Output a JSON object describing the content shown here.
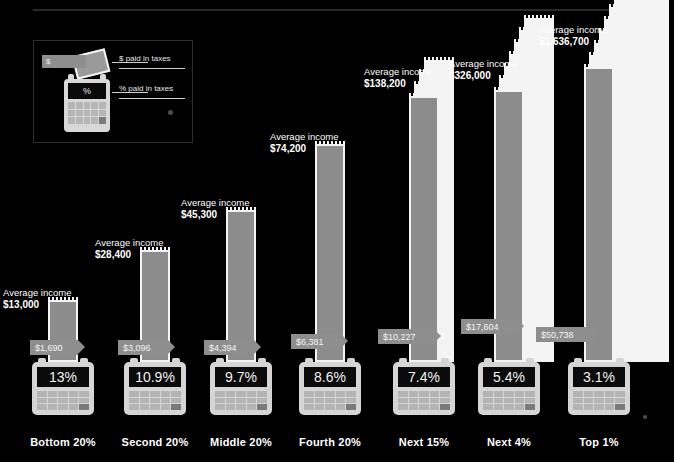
{
  "legend": {
    "dollar_symbol": "$",
    "percent_symbol": "%",
    "label_dollar": "$ paid in taxes",
    "label_percent": "% paid in taxes"
  },
  "labels": {
    "income_caption": "Average income"
  },
  "colors": {
    "background": "#000000",
    "receipt_fill": "#8c8c8c",
    "receipt_border": "#f4f4f4",
    "calculator_body": "#d5d5d5",
    "calculator_screen": "#0b0b0b",
    "tag_fill": "#8e8e8e",
    "text": "#ffffff",
    "rule": "#2a2a2a"
  },
  "chart_data": {
    "type": "bar",
    "title": "",
    "xlabel": "",
    "ylabel": "Average income",
    "categories": [
      "Bottom 20%",
      "Second 20%",
      "Middle 20%",
      "Fourth 20%",
      "Next 15%",
      "Next 4%",
      "Top 1%"
    ],
    "series": [
      {
        "name": "Average income",
        "values": [
          13000,
          28400,
          45300,
          74200,
          138200,
          326000,
          1636700
        ],
        "labels": [
          "$13,000",
          "$28,400",
          "$45,300",
          "$74,200",
          "$138,200",
          "$326,000",
          "$1,636,700"
        ]
      },
      {
        "name": "$ paid in taxes",
        "values": [
          1690,
          3096,
          4394,
          6381,
          10227,
          17604,
          50738
        ],
        "labels": [
          "$1,690",
          "$3,096",
          "$4,394",
          "$6,381",
          "$10,227",
          "$17,604",
          "$50,738"
        ]
      },
      {
        "name": "% paid in taxes",
        "values": [
          13,
          10.9,
          9.7,
          8.6,
          7.4,
          5.4,
          3.1
        ],
        "labels": [
          "13%",
          "10.9%",
          "9.7%",
          "8.6%",
          "7.4%",
          "5.4%",
          "3.1%"
        ]
      }
    ],
    "legend": [
      "$ paid in taxes",
      "% paid in taxes"
    ],
    "legend_position": "top-left",
    "grid": false
  },
  "columns": [
    {
      "category": "Bottom 20%",
      "income": "$13,000",
      "paid": "$1,690",
      "percent": "13%",
      "left": 20,
      "bar_height": 62,
      "bar_bottom": 100,
      "sheets": 1,
      "fan": 0,
      "income_top": 287,
      "tag_bottom": 107,
      "tag_left": 30,
      "tag_width": 48
    },
    {
      "category": "Second 20%",
      "income": "$28,400",
      "paid": "$3,096",
      "percent": "10.9%",
      "left": 112,
      "bar_height": 112,
      "bar_bottom": 100,
      "sheets": 1,
      "fan": 0,
      "income_top": 237,
      "tag_bottom": 107,
      "tag_left": 118,
      "tag_width": 50
    },
    {
      "category": "Middle 20%",
      "income": "$45,300",
      "paid": "$4,394",
      "percent": "9.7%",
      "left": 198,
      "bar_height": 152,
      "bar_bottom": 100,
      "sheets": 1,
      "fan": 0,
      "income_top": 197,
      "tag_bottom": 107,
      "tag_left": 204,
      "tag_width": 50
    },
    {
      "category": "Fourth 20%",
      "income": "$74,200",
      "paid": "$6,381",
      "percent": "8.6%",
      "left": 287,
      "bar_height": 218,
      "bar_bottom": 100,
      "sheets": 1,
      "fan": 0,
      "income_top": 131,
      "tag_bottom": 113,
      "tag_left": 291,
      "tag_width": 50
    },
    {
      "category": "Next 15%",
      "income": "$138,200",
      "paid": "$10,227",
      "percent": "7.4%",
      "left": 381,
      "bar_height": 266,
      "bar_bottom": 100,
      "sheets": 2,
      "fan": 3,
      "income_top": 66,
      "tag_bottom": 118,
      "tag_left": 378,
      "tag_width": 56
    },
    {
      "category": "Next 4%",
      "income": "$326,000",
      "paid": "$17,604",
      "percent": "5.4%",
      "left": 466,
      "bar_height": 272,
      "bar_bottom": 100,
      "sheets": 4,
      "fan": 6,
      "income_top": 58,
      "tag_bottom": 128,
      "tag_left": 461,
      "tag_width": 56
    },
    {
      "category": "Top 1%",
      "income": "$1,636,700",
      "paid": "$50,738",
      "percent": "3.1%",
      "left": 556,
      "bar_height": 295,
      "bar_bottom": 100,
      "sheets": 9,
      "fan": 11,
      "income_top": 24,
      "tag_bottom": 120,
      "tag_left": 536,
      "tag_width": 56
    }
  ]
}
